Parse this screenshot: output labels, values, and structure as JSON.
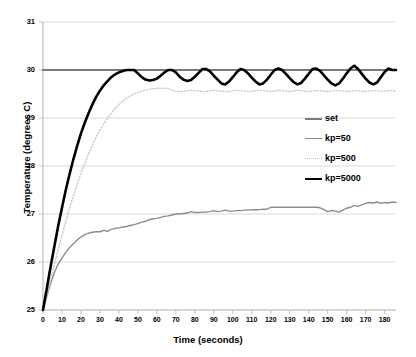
{
  "chart_data": {
    "type": "line",
    "title": "",
    "xlabel": "Time (seconds)",
    "ylabel": "Temperature (degrees C)",
    "xlim": [
      0,
      186
    ],
    "ylim": [
      25,
      31
    ],
    "xticks": [
      0,
      10,
      20,
      30,
      40,
      50,
      60,
      70,
      80,
      90,
      100,
      110,
      120,
      130,
      140,
      150,
      160,
      170,
      180
    ],
    "yticks": [
      25,
      26,
      27,
      28,
      29,
      30,
      31
    ],
    "grid": true,
    "grid_axis": "y",
    "legend_position": "center-right",
    "colors": {
      "set": "#7a7a7a",
      "kp50": "#8d8d8d",
      "kp500": "#c9c9c9",
      "kp5000": "#000000",
      "grid": "#d9d9d9",
      "axis": "#bfbfbf",
      "text": "#000000"
    },
    "series": [
      {
        "name": "set",
        "style": "solid",
        "width": 2,
        "color": "#7a7a7a",
        "x": [
          0,
          186
        ],
        "values": [
          30,
          30
        ]
      },
      {
        "name": "kp=50",
        "style": "solid",
        "width": 1.4,
        "color": "#8d8d8d",
        "x": [
          0,
          2,
          4,
          6,
          8,
          10,
          12,
          14,
          16,
          18,
          20,
          22,
          24,
          26,
          28,
          30,
          32,
          34,
          36,
          38,
          40,
          42,
          44,
          46,
          48,
          50,
          52,
          54,
          56,
          58,
          60,
          62,
          64,
          66,
          68,
          70,
          72,
          74,
          76,
          78,
          80,
          82,
          84,
          86,
          88,
          90,
          92,
          94,
          96,
          98,
          100,
          102,
          104,
          106,
          108,
          110,
          112,
          114,
          116,
          118,
          120,
          122,
          124,
          126,
          128,
          130,
          132,
          134,
          136,
          138,
          140,
          142,
          144,
          146,
          148,
          150,
          152,
          154,
          156,
          158,
          160,
          162,
          164,
          166,
          168,
          170,
          172,
          174,
          176,
          178,
          180,
          182,
          184,
          186
        ],
        "values": [
          25.0,
          25.28,
          25.55,
          25.78,
          25.96,
          26.08,
          26.2,
          26.3,
          26.38,
          26.46,
          26.52,
          26.57,
          26.6,
          26.62,
          26.63,
          26.63,
          26.66,
          26.64,
          26.68,
          26.7,
          26.71,
          26.73,
          26.74,
          26.76,
          26.78,
          26.8,
          26.83,
          26.85,
          26.88,
          26.9,
          26.91,
          26.93,
          26.95,
          26.96,
          26.98,
          27.0,
          27.0,
          27.01,
          27.02,
          27.05,
          27.03,
          27.03,
          27.04,
          27.04,
          27.05,
          27.07,
          27.05,
          27.06,
          27.08,
          27.06,
          27.06,
          27.07,
          27.07,
          27.08,
          27.08,
          27.09,
          27.09,
          27.09,
          27.1,
          27.1,
          27.14,
          27.14,
          27.14,
          27.14,
          27.14,
          27.14,
          27.14,
          27.14,
          27.14,
          27.14,
          27.14,
          27.14,
          27.14,
          27.13,
          27.09,
          27.05,
          27.07,
          27.06,
          27.04,
          27.08,
          27.12,
          27.14,
          27.18,
          27.16,
          27.19,
          27.22,
          27.24,
          27.23,
          27.25,
          27.22,
          27.24,
          27.23,
          27.25,
          27.24
        ]
      },
      {
        "name": "kp=500",
        "style": "dotted",
        "width": 1.4,
        "color": "#c9c9c9",
        "x": [
          0,
          2,
          4,
          6,
          8,
          10,
          12,
          14,
          16,
          18,
          20,
          22,
          24,
          26,
          28,
          30,
          32,
          34,
          36,
          38,
          40,
          42,
          44,
          46,
          48,
          50,
          52,
          54,
          56,
          58,
          60,
          62,
          64,
          66,
          68,
          70,
          72,
          74,
          76,
          78,
          80,
          82,
          84,
          86,
          88,
          90,
          92,
          94,
          96,
          98,
          100,
          102,
          104,
          106,
          108,
          110,
          112,
          114,
          116,
          118,
          120,
          122,
          124,
          126,
          128,
          130,
          132,
          134,
          136,
          138,
          140,
          142,
          144,
          146,
          148,
          150,
          152,
          154,
          156,
          158,
          160,
          162,
          164,
          166,
          168,
          170,
          172,
          174,
          176,
          178,
          180,
          182,
          184,
          186
        ],
        "values": [
          25.0,
          25.3,
          25.62,
          25.95,
          26.25,
          26.55,
          26.85,
          27.12,
          27.38,
          27.62,
          27.85,
          28.05,
          28.25,
          28.43,
          28.6,
          28.75,
          28.88,
          29.0,
          29.1,
          29.2,
          29.28,
          29.35,
          29.41,
          29.46,
          29.5,
          29.53,
          29.56,
          29.58,
          29.6,
          29.61,
          29.62,
          29.62,
          29.62,
          29.61,
          29.58,
          29.56,
          29.55,
          29.55,
          29.57,
          29.58,
          29.57,
          29.56,
          29.55,
          29.55,
          29.57,
          29.58,
          29.57,
          29.56,
          29.55,
          29.55,
          29.57,
          29.58,
          29.57,
          29.56,
          29.55,
          29.55,
          29.57,
          29.58,
          29.57,
          29.56,
          29.55,
          29.56,
          29.58,
          29.57,
          29.56,
          29.55,
          29.56,
          29.58,
          29.57,
          29.56,
          29.55,
          29.56,
          29.57,
          29.57,
          29.56,
          29.55,
          29.56,
          29.57,
          29.57,
          29.56,
          29.55,
          29.56,
          29.57,
          29.57,
          29.56,
          29.55,
          29.56,
          29.57,
          29.57,
          29.56,
          29.56,
          29.57,
          29.57,
          29.56
        ]
      },
      {
        "name": "kp=5000",
        "style": "solid",
        "width": 2.6,
        "color": "#000000",
        "x": [
          0,
          2,
          4,
          6,
          8,
          10,
          12,
          14,
          16,
          18,
          20,
          22,
          24,
          26,
          28,
          30,
          32,
          34,
          36,
          38,
          40,
          42,
          44,
          46,
          48,
          50,
          52,
          54,
          56,
          58,
          60,
          62,
          64,
          66,
          68,
          70,
          72,
          74,
          76,
          78,
          80,
          82,
          84,
          86,
          88,
          90,
          92,
          94,
          96,
          98,
          100,
          102,
          104,
          106,
          108,
          110,
          112,
          114,
          116,
          118,
          120,
          122,
          124,
          126,
          128,
          130,
          132,
          134,
          136,
          138,
          140,
          142,
          144,
          146,
          148,
          150,
          152,
          154,
          156,
          158,
          160,
          162,
          164,
          166,
          168,
          170,
          172,
          174,
          176,
          178,
          180,
          182,
          184,
          186
        ],
        "values": [
          25.0,
          25.45,
          25.9,
          26.33,
          26.75,
          27.13,
          27.5,
          27.83,
          28.14,
          28.42,
          28.68,
          28.9,
          29.1,
          29.28,
          29.44,
          29.57,
          29.68,
          29.77,
          29.85,
          29.91,
          29.95,
          29.98,
          30.0,
          30.0,
          30.0,
          29.93,
          29.85,
          29.8,
          29.78,
          29.79,
          29.82,
          29.88,
          29.95,
          30.0,
          30.0,
          29.95,
          29.86,
          29.8,
          29.77,
          29.79,
          29.86,
          29.94,
          30.02,
          30.02,
          29.97,
          29.88,
          29.8,
          29.72,
          29.7,
          29.76,
          29.85,
          29.95,
          30.02,
          30.0,
          29.93,
          29.84,
          29.76,
          29.7,
          29.72,
          29.8,
          29.9,
          30.0,
          30.03,
          30.0,
          29.92,
          29.83,
          29.75,
          29.7,
          29.73,
          29.82,
          29.92,
          30.02,
          30.03,
          29.98,
          29.89,
          29.8,
          29.72,
          29.68,
          29.72,
          29.82,
          29.93,
          30.03,
          30.09,
          30.02,
          29.92,
          29.82,
          29.74,
          29.7,
          29.74,
          29.85,
          29.96,
          30.03,
          30.0,
          30.0
        ]
      }
    ]
  },
  "legend": {
    "items": [
      {
        "label": "set"
      },
      {
        "label": "kp=50"
      },
      {
        "label": "kp=500"
      },
      {
        "label": "kp=5000"
      }
    ]
  },
  "axes": {
    "xlabel": "Time (seconds)",
    "ylabel": "Temperature (degrees C)",
    "ytick_labels": [
      "25",
      "26",
      "27",
      "28",
      "29",
      "30",
      "31"
    ],
    "xtick_labels": [
      "0",
      "10",
      "20",
      "30",
      "40",
      "50",
      "60",
      "70",
      "80",
      "90",
      "100",
      "110",
      "120",
      "130",
      "140",
      "150",
      "160",
      "170",
      "180"
    ]
  }
}
